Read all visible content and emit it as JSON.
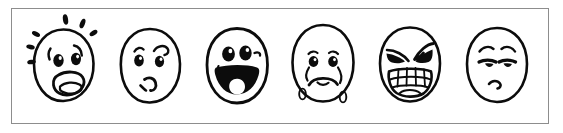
{
  "image": {
    "title": "Six hand-drawn cartoon emotion faces",
    "description": "A bordered horizontal strip containing six black-ink hand-drawn round faces, each showing a different emotional expression.",
    "medium": "black ink line drawing on white background",
    "background_color": "#ffffff",
    "ink_color": "#0c0c0c",
    "border_color": "#8d8d8d",
    "face_count": "6"
  },
  "frame": {
    "style": "thin rectangular outline",
    "label": "illustration-frame"
  },
  "faces": [
    {
      "index": "1",
      "emotion": "scared",
      "label": "Scared / Frightened",
      "eyes": "wide round open eyes with large pupils",
      "eyebrows": "short raised curved brows",
      "mouth": "wide open oval mouth with tongue",
      "extras": "sweat droplets flying off around the head",
      "droplet_count": "5"
    },
    {
      "index": "2",
      "emotion": "confused",
      "label": "Confused / Skeptical",
      "eyes": "round eyes, one narrowed",
      "eyebrows": "one raised curled eyebrow, asymmetric",
      "mouth": "small crooked off-center mouth",
      "extras": "none",
      "droplet_count": "0"
    },
    {
      "index": "3",
      "emotion": "happy",
      "label": "Happy / Joyful",
      "eyes": "two large filled oval eyes",
      "eyebrows": "none",
      "mouth": "wide filled open grin with tongue",
      "extras": "small curl at mouth corner",
      "droplet_count": "0"
    },
    {
      "index": "4",
      "emotion": "sad",
      "label": "Sad / Crying",
      "eyes": "downturned eyes with pupils",
      "eyebrows": "short arched brows",
      "mouth": "downturned frown",
      "extras": "tears streaming down cheeks and droplets falling below chin",
      "droplet_count": "4"
    },
    {
      "index": "5",
      "emotion": "angry",
      "label": "Angry / Furious",
      "eyes": "narrowed slanted filled eyes",
      "eyebrows": "sharp V-shaped furrowed brows",
      "mouth": "wide grimace showing gritted teeth",
      "extras": "gritted teeth with vertical divider lines",
      "droplet_count": "0"
    },
    {
      "index": "6",
      "emotion": "bored",
      "label": "Bored / Unimpressed",
      "eyes": "half-lidded droopy eyes with heavy upper lids",
      "eyebrows": "high thin curved brows",
      "mouth": "small wavy slight frown",
      "extras": "none",
      "droplet_count": "0"
    }
  ]
}
